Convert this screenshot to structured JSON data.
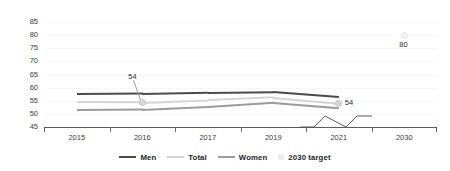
{
  "chart_data": {
    "type": "line",
    "title": "",
    "xlabel": "",
    "ylabel": "",
    "categories": [
      "2015",
      "2016",
      "2017",
      "2019",
      "2021",
      "2030"
    ],
    "ylim": [
      45,
      85
    ],
    "yticks": [
      45,
      50,
      55,
      60,
      65,
      70,
      75,
      80,
      85
    ],
    "grid": true,
    "legend_position": "bottom",
    "axis_break": "between 2021 and 2030",
    "series": [
      {
        "name": "Men",
        "color": "#4a4a4f",
        "values": [
          57.4,
          57.6,
          58.1,
          58.4,
          56.5,
          null
        ]
      },
      {
        "name": "Total",
        "color": "#d4d4d8",
        "values": [
          54.4,
          54.3,
          55.2,
          56.2,
          54.0,
          null
        ]
      },
      {
        "name": "Women",
        "color": "#9a9aa0",
        "values": [
          51.4,
          51.6,
          52.7,
          54.3,
          52.3,
          null
        ]
      },
      {
        "name": "2030 target",
        "color": "#f1f1f4",
        "values": [
          null,
          null,
          null,
          null,
          null,
          80
        ]
      }
    ],
    "annotations": [
      {
        "label": "54",
        "series": "Total",
        "category": "2016",
        "value": 54.3,
        "style": "callout-leader"
      },
      {
        "label": "54",
        "series": "Total",
        "category": "2021",
        "value": 54.0,
        "style": "marker-right"
      },
      {
        "label": "80",
        "series": "2030 target",
        "category": "2030",
        "value": 80,
        "style": "marker-below"
      }
    ]
  },
  "yaxis": {
    "ticks": [
      "85",
      "80",
      "75",
      "70",
      "65",
      "60",
      "55",
      "50",
      "45"
    ]
  },
  "xaxis": {
    "labels": [
      "2015",
      "2016",
      "2017",
      "2019",
      "2021",
      "2030"
    ]
  },
  "legend": {
    "items": [
      {
        "label": "Men",
        "color": "#4a4a4f",
        "shape": "line"
      },
      {
        "label": "Total",
        "color": "#d4d4d8",
        "shape": "line"
      },
      {
        "label": "Women",
        "color": "#9a9aa0",
        "shape": "line"
      },
      {
        "label": "2030 target",
        "color": "#ececf0",
        "shape": "square"
      }
    ]
  },
  "annotations": {
    "label_2016": "54",
    "label_2021": "54",
    "label_2030": "80"
  },
  "top_strip": {
    "text": ""
  }
}
